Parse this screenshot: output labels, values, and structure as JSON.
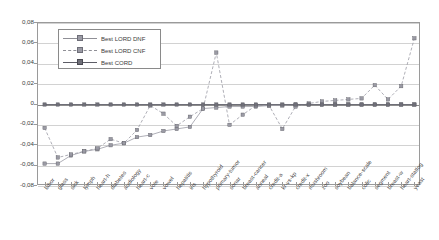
{
  "chart_data": {
    "type": "line",
    "title": "",
    "subtitle": "",
    "xlabel": "",
    "ylabel": "",
    "ylim": [
      -0.08,
      0.08
    ],
    "ytick_values": [
      0.08,
      0.06,
      0.04,
      0.02,
      0,
      -0.02,
      -0.04,
      -0.06,
      -0.08
    ],
    "ytick_labels": [
      "0,08",
      "0,06",
      "0,04",
      "0,02",
      "0",
      "-0,02",
      "-0,04",
      "-0,06",
      "-0,08"
    ],
    "grid": true,
    "grid_axis": "y",
    "legend_position": "upper-left-inside",
    "decimal_separator": ",",
    "categories": [
      "labor",
      "glass",
      "sick",
      "lymph",
      "heart-h",
      "diabetes",
      "audiology",
      "heart-c",
      "vote",
      "vowel",
      "hepatitis",
      "iris",
      "hypothyroid",
      "primary-tumor",
      "sonar",
      "breast-cancer",
      "anneal",
      "credit-a",
      "kr-vs-kp",
      "credit-x",
      "mushroom",
      "zoo",
      "soybean",
      "balance-scale",
      "colic",
      "segment",
      "breast-w",
      "heart-statlog",
      "yeast"
    ],
    "series": [
      {
        "name": "Best LORD DNF",
        "marker": "square",
        "linestyle": "solid-light",
        "color": "#9a9aa4",
        "values": [
          -0.058,
          -0.058,
          -0.05,
          -0.046,
          -0.044,
          -0.04,
          -0.038,
          -0.032,
          -0.03,
          -0.026,
          -0.024,
          -0.022,
          -0.004,
          -0.003,
          -0.002,
          -0.002,
          -0.002,
          -0.001,
          -0.001,
          0.0,
          0.0,
          0.0,
          0.0,
          0.0,
          0.0,
          0.0,
          0.0,
          0.0,
          0.0
        ]
      },
      {
        "name": "Best LORD CNF",
        "marker": "square",
        "linestyle": "dashed",
        "color": "#9a9aa4",
        "values": [
          -0.023,
          -0.052,
          -0.049,
          -0.046,
          -0.043,
          -0.034,
          -0.038,
          -0.025,
          -0.001,
          -0.009,
          -0.021,
          -0.012,
          -0.004,
          0.051,
          -0.02,
          -0.01,
          -0.001,
          -0.001,
          -0.024,
          -0.002,
          0.001,
          0.003,
          0.004,
          0.005,
          0.006,
          0.019,
          0.005,
          0.018,
          0.065
        ]
      },
      {
        "name": "Best CORD",
        "marker": "square",
        "linestyle": "solid",
        "color": "#6f6f78",
        "values": [
          0,
          0,
          0,
          0,
          0,
          0,
          0,
          0,
          0,
          0,
          0,
          0,
          0,
          0,
          0,
          0,
          0,
          0,
          0,
          0,
          0,
          0,
          0,
          0,
          0,
          0,
          0,
          0,
          0
        ]
      }
    ]
  },
  "legend": {
    "items": [
      {
        "label": "Best LORD DNF"
      },
      {
        "label": "Best LORD CNF"
      },
      {
        "label": "Best CORD"
      }
    ]
  }
}
